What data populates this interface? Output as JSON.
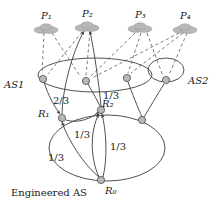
{
  "figure": {
    "title_caption": "",
    "background_color": "#ffffff",
    "node_fill_color": "#b9b9b9",
    "node_stroke_color": "#4a4a4a",
    "line_color": "#3d3d3d",
    "cloud_color": "#b7b7b7"
  },
  "peers": [
    {
      "id": "P1",
      "label": "P₁",
      "x": 47,
      "y": 28,
      "label_x": 41,
      "label_y": 16
    },
    {
      "id": "P2",
      "label": "P₂",
      "x": 88,
      "y": 26,
      "label_x": 82,
      "label_y": 14
    },
    {
      "id": "P3",
      "label": "P₃",
      "x": 141,
      "y": 27,
      "label_x": 135,
      "label_y": 15
    },
    {
      "id": "P4",
      "label": "P₄",
      "x": 186,
      "y": 28,
      "label_x": 180,
      "label_y": 16
    }
  ],
  "domains": [
    {
      "id": "AS1",
      "label": "AS1",
      "label_x": 8,
      "label_y": 85,
      "cx": 95,
      "cy": 75,
      "rx": 57,
      "ry": 17
    },
    {
      "id": "AS2",
      "label": "AS2",
      "label_x": 188,
      "label_y": 82,
      "cx": 166,
      "cy": 70,
      "rx": 18,
      "ry": 12
    },
    {
      "id": "EngineeredAS",
      "label": "Engineered AS",
      "label_x": 12,
      "label_y": 194,
      "cx": 107,
      "cy": 148,
      "rx": 58,
      "ry": 33
    }
  ],
  "nodes": [
    {
      "id": "n_as1_left",
      "label": "",
      "x": 43,
      "y": 79,
      "label_x": 0,
      "label_y": 0
    },
    {
      "id": "n_as1_mid",
      "label": "",
      "x": 84,
      "y": 81,
      "label_x": 0,
      "label_y": 0
    },
    {
      "id": "n_as1_right",
      "label": "",
      "x": 127,
      "y": 78,
      "label_x": 0,
      "label_y": 0
    },
    {
      "id": "n_as2",
      "label": "",
      "x": 166,
      "y": 80,
      "label_x": 0,
      "label_y": 0
    },
    {
      "id": "R1",
      "label": "R₁",
      "x": 62,
      "y": 118,
      "label_x": 40,
      "label_y": 116
    },
    {
      "id": "R2",
      "label": "R₂",
      "x": 101,
      "y": 110,
      "label_x": 103,
      "label_y": 107
    },
    {
      "id": "n_right_low",
      "label": "",
      "x": 142,
      "y": 120,
      "label_x": 0,
      "label_y": 0
    },
    {
      "id": "R0",
      "label": "R₀",
      "x": 101,
      "y": 180,
      "label_x": 105,
      "label_y": 192
    }
  ],
  "edge_labels": [
    {
      "id": "w_r1_as1",
      "text": "2/3",
      "x": 63,
      "y": 101
    },
    {
      "id": "w_r2_as1",
      "text": "1/3",
      "x": 104,
      "y": 97
    },
    {
      "id": "w_r0_r1",
      "text": "1/3",
      "x": 59,
      "y": 157
    },
    {
      "id": "w_r0_mid",
      "text": "1/3",
      "x": 84,
      "y": 134
    },
    {
      "id": "w_r0_r2",
      "text": "1/3",
      "x": 115,
      "y": 146
    }
  ],
  "solid_edges": [
    {
      "from": "n_as1_left",
      "to": "R1",
      "arrow": true
    },
    {
      "from": "n_as1_mid",
      "to": "R2",
      "arrow": false
    },
    {
      "from": "n_as1_right",
      "to": "n_right_low",
      "arrow": false
    },
    {
      "from": "n_as2",
      "to": "n_right_low",
      "arrow": false
    },
    {
      "from": "R0",
      "to": "R1",
      "arrow": true
    },
    {
      "from": "R0",
      "to": "R2",
      "arrow": true
    },
    {
      "from": "R1",
      "to": "n_as1_mid",
      "arrow": true
    },
    {
      "from": "R1",
      "to": "P2",
      "arrow": true
    },
    {
      "from": "R2",
      "to": "P2",
      "arrow": true
    }
  ],
  "dashed_edges": [
    {
      "from": "P1",
      "to": "n_as1_left"
    },
    {
      "from": "P1",
      "to": "n_as1_mid"
    },
    {
      "from": "P2",
      "to": "n_as1_left"
    },
    {
      "from": "P2",
      "to": "n_as1_mid"
    },
    {
      "from": "P3",
      "to": "n_as1_mid"
    },
    {
      "from": "P3",
      "to": "n_as1_right"
    },
    {
      "from": "P3",
      "to": "n_as2"
    },
    {
      "from": "P4",
      "to": "n_as1_mid"
    },
    {
      "from": "P4",
      "to": "n_as1_right"
    },
    {
      "from": "P4",
      "to": "n_as2"
    }
  ]
}
